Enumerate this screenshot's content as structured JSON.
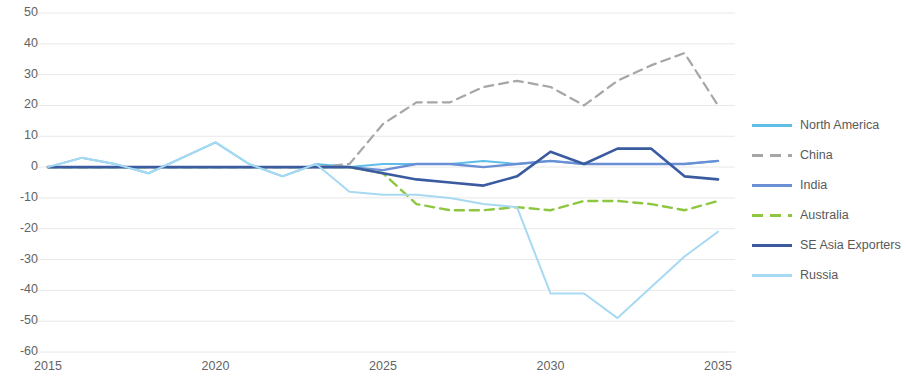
{
  "chart_data": {
    "type": "line",
    "title": "",
    "subtitle": "",
    "xlabel": "",
    "ylabel": "",
    "xlim": [
      2015,
      2035
    ],
    "ylim": [
      -60,
      50
    ],
    "ytick_step": 10,
    "grid": "horizontal",
    "legend_position": "right",
    "x": [
      2015,
      2016,
      2017,
      2018,
      2019,
      2020,
      2021,
      2022,
      2023,
      2024,
      2025,
      2026,
      2027,
      2028,
      2029,
      2030,
      2031,
      2032,
      2033,
      2034,
      2035
    ],
    "xtick_labels": [
      "2015",
      "2020",
      "2025",
      "2030",
      "2035"
    ],
    "xticks": [
      2015,
      2020,
      2025,
      2030,
      2035
    ],
    "ytick_labels": [
      "50",
      "40",
      "30",
      "20",
      "10",
      "0",
      "-10",
      "-20",
      "-30",
      "-40",
      "-50",
      "-60"
    ],
    "yticks": [
      50,
      40,
      30,
      20,
      10,
      0,
      -10,
      -20,
      -30,
      -40,
      -50,
      -60
    ],
    "series": [
      {
        "name": "North America",
        "color": "#5FBDE8",
        "dash": "solid",
        "width": 2,
        "values": [
          0,
          3,
          1,
          -2,
          3,
          8,
          1,
          -3,
          1,
          0,
          1,
          1,
          1,
          2,
          1,
          2,
          1,
          1,
          1,
          1,
          2
        ]
      },
      {
        "name": "China",
        "color": "#A6A6A6",
        "dash": "dashed",
        "width": 2.2,
        "values": [
          0,
          0,
          0,
          0,
          0,
          0,
          0,
          0,
          0,
          1,
          14,
          21,
          21,
          26,
          28,
          26,
          20,
          28,
          33,
          37,
          20
        ]
      },
      {
        "name": "India",
        "color": "#6B8FD4",
        "dash": "solid",
        "width": 2.4,
        "values": [
          0,
          0,
          0,
          0,
          0,
          0,
          0,
          0,
          0,
          0,
          -1,
          1,
          1,
          0,
          1,
          2,
          1,
          1,
          1,
          1,
          2
        ]
      },
      {
        "name": "Australia",
        "color": "#8DC63F",
        "dash": "dashed",
        "width": 2.4,
        "values": [
          0,
          0,
          0,
          0,
          0,
          0,
          0,
          0,
          0,
          0,
          -2,
          -12,
          -14,
          -14,
          -13,
          -14,
          -11,
          -11,
          -12,
          -14,
          -11
        ]
      },
      {
        "name": "SE Asia Exporters",
        "color": "#3A5BA0",
        "dash": "solid",
        "width": 2.6,
        "values": [
          0,
          0,
          0,
          0,
          0,
          0,
          0,
          0,
          0,
          0,
          -2,
          -4,
          -5,
          -6,
          -3,
          5,
          1,
          6,
          6,
          -3,
          -4
        ]
      },
      {
        "name": "Russia",
        "color": "#A7D9F2",
        "dash": "solid",
        "width": 2,
        "values": [
          0,
          3,
          1,
          -2,
          3,
          8,
          1,
          -3,
          1,
          -8,
          -9,
          -9,
          -10,
          -12,
          -13,
          -41,
          -41,
          -49,
          -39,
          -29,
          -21
        ]
      }
    ]
  },
  "legend": {
    "items": [
      {
        "label": "North America",
        "color": "#5FBDE8",
        "dash": "solid"
      },
      {
        "label": "China",
        "color": "#A6A6A6",
        "dash": "dashed"
      },
      {
        "label": "India",
        "color": "#6B8FD4",
        "dash": "solid"
      },
      {
        "label": "Australia",
        "color": "#8DC63F",
        "dash": "dashed"
      },
      {
        "label": "SE Asia Exporters",
        "color": "#3A5BA0",
        "dash": "solid"
      },
      {
        "label": "Russia",
        "color": "#A7D9F2",
        "dash": "solid"
      }
    ]
  }
}
